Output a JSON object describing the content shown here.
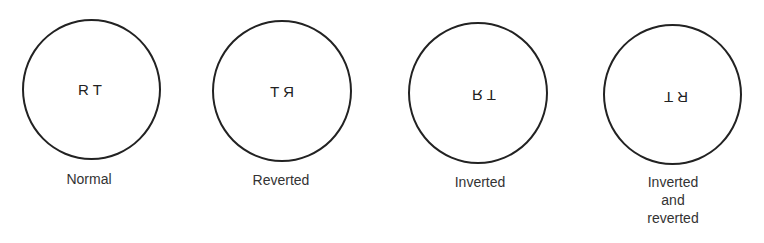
{
  "figure": {
    "letters": "R T",
    "panels": [
      {
        "id": "normal",
        "label_lines": [
          "Normal"
        ],
        "transform": "none"
      },
      {
        "id": "reverted",
        "label_lines": [
          "Reverted"
        ],
        "transform": "mirror-horizontal"
      },
      {
        "id": "inverted",
        "label_lines": [
          "Inverted"
        ],
        "transform": "mirror-vertical"
      },
      {
        "id": "inverted-and-reverted",
        "label_lines": [
          "Inverted",
          "and",
          "reverted"
        ],
        "transform": "rotate-180"
      }
    ]
  }
}
